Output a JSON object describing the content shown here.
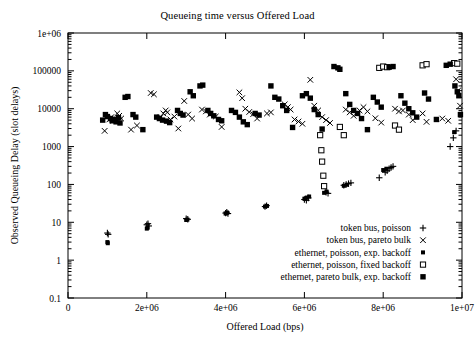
{
  "chart_data": {
    "type": "scatter",
    "title": "Queueing time versus Offered Load",
    "xlabel": "Offered Load (bps)",
    "ylabel": "Observed Queueing Delay (slot delays)",
    "xscale": "linear",
    "yscale": "log",
    "xlim": [
      0,
      10000000
    ],
    "ylim": [
      0.1,
      1000000
    ],
    "xticks": [
      0,
      2000000,
      4000000,
      6000000,
      8000000,
      10000000
    ],
    "xticklabels": [
      "0",
      "2e+06",
      "4e+06",
      "6e+06",
      "8e+06",
      "1e+07"
    ],
    "yticks": [
      0.1,
      1,
      10,
      100,
      1000,
      10000,
      100000,
      1000000
    ],
    "yticklabels": [
      "0.1",
      "1",
      "10",
      "100",
      "1000",
      "10000",
      "100000",
      "1e+06"
    ],
    "grid": false,
    "legend_position": "lower right",
    "series": [
      {
        "name": "token bus, poisson",
        "marker": "plus",
        "color": "#000000",
        "points": [
          [
            1000000,
            5.2
          ],
          [
            1020000,
            4.8
          ],
          [
            2000000,
            8.6
          ],
          [
            2030000,
            9.2
          ],
          [
            2050000,
            8.0
          ],
          [
            3000000,
            12.5
          ],
          [
            3040000,
            12.0
          ],
          [
            4000000,
            17.5
          ],
          [
            4030000,
            18.5
          ],
          [
            4060000,
            17.0
          ],
          [
            5000000,
            26.0
          ],
          [
            5040000,
            27.5
          ],
          [
            6000000,
            40.0
          ],
          [
            6050000,
            38.0
          ],
          [
            6100000,
            44.0
          ],
          [
            6550000,
            62.0
          ],
          [
            6600000,
            58.0
          ],
          [
            7000000,
            95.0
          ],
          [
            7060000,
            100.0
          ],
          [
            7120000,
            105.0
          ],
          [
            7180000,
            110.0
          ],
          [
            7900000,
            150.0
          ],
          [
            8050000,
            210.0
          ],
          [
            8100000,
            230.0
          ],
          [
            8150000,
            260.0
          ],
          [
            8200000,
            280.0
          ],
          [
            8250000,
            300.0
          ],
          [
            9700000,
            1000.0
          ],
          [
            9780000,
            1700.0
          ],
          [
            9850000,
            2600.0
          ]
        ]
      },
      {
        "name": "token bus, pareto bulk",
        "marker": "cross",
        "color": "#000000",
        "points": [
          [
            930000,
            2600.0
          ],
          [
            1050000,
            5200.0
          ],
          [
            1100000,
            6000.0
          ],
          [
            1150000,
            4800.0
          ],
          [
            1250000,
            7500.0
          ],
          [
            1300000,
            6500.0
          ],
          [
            1350000,
            5500.0
          ],
          [
            1600000,
            2800.0
          ],
          [
            1750000,
            3600.0
          ],
          [
            2100000,
            26000.0
          ],
          [
            2180000,
            24000.0
          ],
          [
            2350000,
            6000.0
          ],
          [
            2420000,
            7500.0
          ],
          [
            2480000,
            9000.0
          ],
          [
            2520000,
            8000.0
          ],
          [
            2600000,
            5200.0
          ],
          [
            2700000,
            6200.0
          ],
          [
            2800000,
            3000.0
          ],
          [
            2950000,
            16000.0
          ],
          [
            3050000,
            7000.0
          ],
          [
            3150000,
            5500.0
          ],
          [
            3400000,
            9500.0
          ],
          [
            3500000,
            8500.0
          ],
          [
            3600000,
            7000.0
          ],
          [
            3750000,
            6200.0
          ],
          [
            3900000,
            3300.0
          ],
          [
            4350000,
            27000.0
          ],
          [
            4420000,
            19000.0
          ],
          [
            4500000,
            10000.0
          ],
          [
            4600000,
            8200.0
          ],
          [
            4700000,
            7200.0
          ],
          [
            4800000,
            5500.0
          ],
          [
            5050000,
            7500.0
          ],
          [
            5150000,
            8000.0
          ],
          [
            5500000,
            13000.0
          ],
          [
            5580000,
            11000.0
          ],
          [
            5650000,
            9500.0
          ],
          [
            5750000,
            5200.0
          ],
          [
            5850000,
            4600.0
          ],
          [
            5950000,
            4000.0
          ],
          [
            6150000,
            58000.0
          ],
          [
            6250000,
            12000.0
          ],
          [
            6350000,
            9000.0
          ],
          [
            6450000,
            6000.0
          ],
          [
            6550000,
            5000.0
          ],
          [
            6650000,
            4200.0
          ],
          [
            7050000,
            9500.0
          ],
          [
            7150000,
            8000.0
          ],
          [
            7250000,
            6500.0
          ],
          [
            7400000,
            9000.0
          ],
          [
            7500000,
            11000.0
          ],
          [
            7600000,
            8500.0
          ],
          [
            7800000,
            5600.0
          ],
          [
            7950000,
            4300.0
          ],
          [
            8300000,
            10000.0
          ],
          [
            8400000,
            8500.0
          ],
          [
            8500000,
            9000.0
          ],
          [
            8650000,
            7000.0
          ],
          [
            8750000,
            5000.0
          ],
          [
            9000000,
            7500.0
          ],
          [
            9100000,
            4500.0
          ],
          [
            9500000,
            5500.0
          ],
          [
            9650000,
            4800.0
          ],
          [
            9850000,
            60000.0
          ],
          [
            9900000,
            30000.0
          ],
          [
            9950000,
            12000.0
          ]
        ]
      },
      {
        "name": "ethernet, poisson, exp. backoff",
        "marker": "small-filled-square",
        "color": "#000000",
        "points": [
          [
            1000000,
            3.0
          ],
          [
            1010000,
            2.8
          ],
          [
            2000000,
            6.8
          ],
          [
            2020000,
            7.2
          ],
          [
            3000000,
            11.5
          ],
          [
            3030000,
            11.8
          ],
          [
            4000000,
            17.0
          ],
          [
            4040000,
            17.8
          ],
          [
            5000000,
            26.0
          ],
          [
            5050000,
            27.0
          ],
          [
            6000000,
            42.0
          ],
          [
            6060000,
            45.0
          ],
          [
            6120000,
            48.0
          ],
          [
            6500000,
            60.0
          ],
          [
            6560000,
            65.0
          ],
          [
            7000000,
            92.0
          ],
          [
            7080000,
            98.0
          ],
          [
            8000000,
            240.0
          ],
          [
            8080000,
            260.0
          ],
          [
            9800000,
            2400.0
          ]
        ]
      },
      {
        "name": "ethernet, poisson, fixed backoff",
        "marker": "open-square",
        "color": "#000000",
        "points": [
          [
            6400000,
            2000.0
          ],
          [
            6430000,
            800.0
          ],
          [
            6450000,
            400.0
          ],
          [
            6480000,
            170.0
          ],
          [
            6500000,
            90.0
          ],
          [
            6900000,
            3300.0
          ],
          [
            7000000,
            2000.0
          ],
          [
            7900000,
            120000.0
          ],
          [
            8000000,
            130000.0
          ],
          [
            8100000,
            125000.0
          ],
          [
            8300000,
            3600.0
          ],
          [
            8400000,
            2800.0
          ],
          [
            9000000,
            140000.0
          ],
          [
            9100000,
            150000.0
          ],
          [
            9800000,
            160000.0
          ],
          [
            9880000,
            155000.0
          ]
        ]
      },
      {
        "name": "ethernet, pareto bulk, exp. backoff",
        "marker": "filled-square",
        "color": "#000000",
        "points": [
          [
            880000,
            5000.0
          ],
          [
            950000,
            7000.0
          ],
          [
            1000000,
            6200.0
          ],
          [
            1080000,
            5500.0
          ],
          [
            1120000,
            4800.0
          ],
          [
            1180000,
            5200.0
          ],
          [
            1220000,
            4500.0
          ],
          [
            1280000,
            5800.0
          ],
          [
            1320000,
            4200.0
          ],
          [
            1450000,
            20000.0
          ],
          [
            1520000,
            21000.0
          ],
          [
            1650000,
            7000.0
          ],
          [
            1720000,
            6000.0
          ],
          [
            1900000,
            2800.0
          ],
          [
            2250000,
            6000.0
          ],
          [
            2320000,
            5500.0
          ],
          [
            2400000,
            5000.0
          ],
          [
            2500000,
            4700.0
          ],
          [
            2580000,
            4300.0
          ],
          [
            2780000,
            9000.0
          ],
          [
            2850000,
            7500.0
          ],
          [
            2920000,
            6800.0
          ],
          [
            3100000,
            28000.0
          ],
          [
            3180000,
            22000.0
          ],
          [
            3350000,
            40000.0
          ],
          [
            3420000,
            42000.0
          ],
          [
            3550000,
            9000.0
          ],
          [
            3620000,
            7500.0
          ],
          [
            3700000,
            6500.0
          ],
          [
            3820000,
            5200.0
          ],
          [
            3900000,
            4800.0
          ],
          [
            4150000,
            9000.0
          ],
          [
            4250000,
            8000.0
          ],
          [
            4350000,
            6000.0
          ],
          [
            4450000,
            4500.0
          ],
          [
            4550000,
            3800.0
          ],
          [
            4750000,
            7500.0
          ],
          [
            4850000,
            6800.0
          ],
          [
            5150000,
            40000.0
          ],
          [
            5250000,
            20000.0
          ],
          [
            5350000,
            18000.0
          ],
          [
            5450000,
            12000.0
          ],
          [
            5550000,
            9000.0
          ],
          [
            5700000,
            3200.0
          ],
          [
            5950000,
            22000.0
          ],
          [
            6050000,
            25000.0
          ],
          [
            6150000,
            19000.0
          ],
          [
            6250000,
            9500.0
          ],
          [
            6350000,
            7000.0
          ],
          [
            6450000,
            2900.0
          ],
          [
            6750000,
            130000.0
          ],
          [
            6850000,
            120000.0
          ],
          [
            6900000,
            110000.0
          ],
          [
            7050000,
            25000.0
          ],
          [
            7150000,
            13000.0
          ],
          [
            7250000,
            9000.0
          ],
          [
            7350000,
            7500.0
          ],
          [
            7450000,
            5500.0
          ],
          [
            7600000,
            2800.0
          ],
          [
            7750000,
            20000.0
          ],
          [
            7850000,
            15000.0
          ],
          [
            7950000,
            11000.0
          ],
          [
            8150000,
            125000.0
          ],
          [
            8250000,
            130000.0
          ],
          [
            8450000,
            22000.0
          ],
          [
            8550000,
            14000.0
          ],
          [
            8650000,
            10000.0
          ],
          [
            8750000,
            7800.0
          ],
          [
            8850000,
            6000.0
          ],
          [
            9050000,
            26000.0
          ],
          [
            9150000,
            18000.0
          ],
          [
            9350000,
            5200.0
          ],
          [
            9600000,
            140000.0
          ],
          [
            9700000,
            150000.0
          ],
          [
            9820000,
            40000.0
          ],
          [
            9880000,
            28000.0
          ],
          [
            9920000,
            22000.0
          ],
          [
            9960000,
            7000.0
          ]
        ]
      }
    ]
  },
  "legend": {
    "entries": [
      {
        "label": "token bus, poisson",
        "marker": "+"
      },
      {
        "label": "token bus, pareto bulk",
        "marker": "x"
      },
      {
        "label": "ethernet, poisson, exp. backoff",
        "marker": "sq-sm"
      },
      {
        "label": "ethernet, poisson, fixed backoff",
        "marker": "sq-open"
      },
      {
        "label": "ethernet, pareto bulk, exp. backoff",
        "marker": "sq-fill"
      }
    ]
  }
}
